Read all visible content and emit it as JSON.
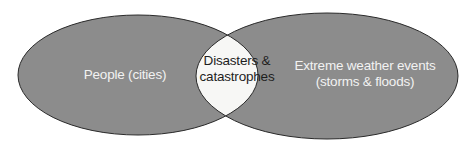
{
  "diagram": {
    "type": "venn",
    "colors": {
      "fill": "#8c8c8c",
      "intersection": "#f7f7f5",
      "stroke": "#2a2a2a",
      "light_text": "#f2f2f2",
      "dark_text": "#1e1e1e"
    },
    "sets": [
      {
        "id": "left",
        "label": "People (cities)"
      },
      {
        "id": "right",
        "label_line1": "Extreme weather events",
        "label_line2": "(storms & floods)"
      }
    ],
    "intersection": {
      "label_line1": "Disasters &",
      "label_line2": "catastrophes"
    }
  }
}
